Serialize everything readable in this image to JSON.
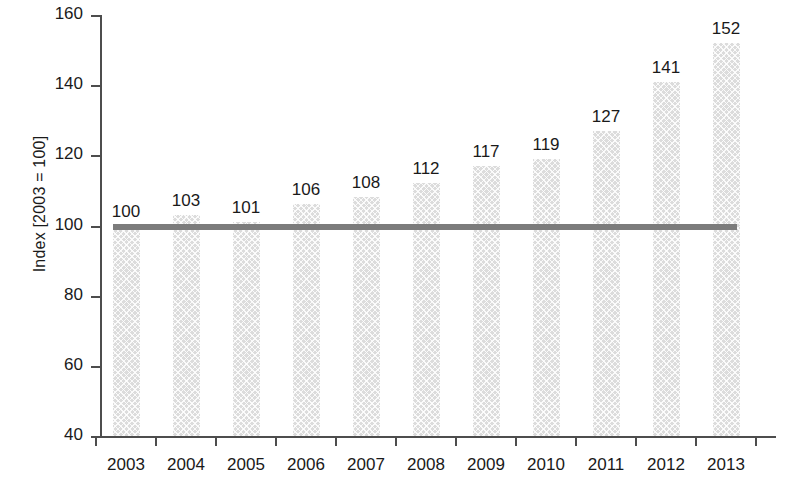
{
  "chart_data": {
    "type": "bar",
    "title": "",
    "subtitle": "",
    "xlabel": "",
    "ylabel": "Index [2003 = 100]",
    "categories": [
      "2003",
      "2004",
      "2005",
      "2006",
      "2007",
      "2008",
      "2009",
      "2010",
      "2011",
      "2012",
      "2013"
    ],
    "values": [
      100,
      103,
      101,
      106,
      108,
      112,
      117,
      119,
      127,
      141,
      152
    ],
    "data_labels": [
      "100",
      "103",
      "101",
      "106",
      "108",
      "112",
      "117",
      "119",
      "127",
      "141",
      "152"
    ],
    "ylim": [
      40,
      160
    ],
    "y_ticks": [
      40,
      60,
      80,
      100,
      120,
      140,
      160
    ],
    "y_tick_labels": [
      "40",
      "60",
      "80",
      "100",
      "120",
      "140",
      "160"
    ],
    "grid": false,
    "legend": null,
    "legend_position": "none",
    "annotations": [
      {
        "name": "baseline-reference-line",
        "type": "horizontal-line",
        "value": 100,
        "color": "#7c7c7c",
        "x_start": "2003",
        "x_end": "2013"
      }
    ],
    "series": [
      {
        "name": "Index",
        "values": [
          100,
          103,
          101,
          106,
          108,
          112,
          117,
          119,
          127,
          141,
          152
        ],
        "color": "#dcdcdc",
        "pattern": "crosshatch"
      }
    ],
    "colors": {
      "bar_fill": "#dcdcdc",
      "reference_line": "#7c7c7c",
      "axis": "#4d4d4d",
      "text": "#1a1a1a",
      "background": "#ffffff"
    }
  }
}
